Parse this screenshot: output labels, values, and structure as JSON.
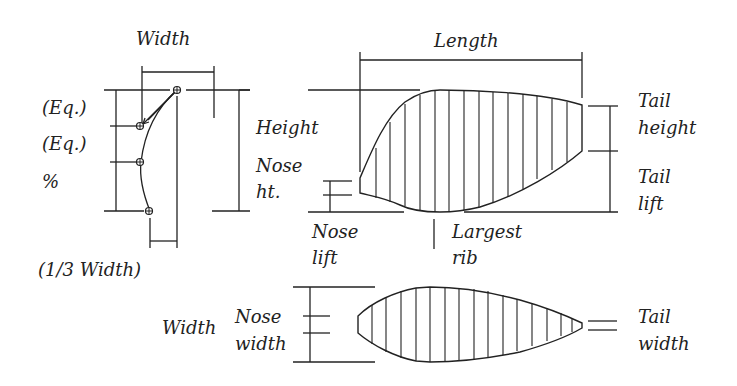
{
  "diagram": {
    "cross_section": {
      "width_label": "Width",
      "eq1_label": "(Eq.)",
      "eq2_label": "(Eq.)",
      "percent_label": "%",
      "third_width_label": "(1/3 Width)"
    },
    "side_view": {
      "length_label": "Length",
      "height_label": "Height",
      "nose_ht_label_1": "Nose",
      "nose_ht_label_2": "ht.",
      "nose_lift_label_1": "Nose",
      "nose_lift_label_2": "lift",
      "largest_rib_label_1": "Largest",
      "largest_rib_label_2": "rib",
      "tail_height_label_1": "Tail",
      "tail_height_label_2": "height",
      "tail_lift_label_1": "Tail",
      "tail_lift_label_2": "lift"
    },
    "plan_view": {
      "width_label": "Width",
      "nose_width_label_1": "Nose",
      "nose_width_label_2": "width",
      "tail_width_label_1": "Tail",
      "tail_width_label_2": "width"
    },
    "colors": {
      "line": "#222222",
      "background": "#ffffff"
    }
  }
}
